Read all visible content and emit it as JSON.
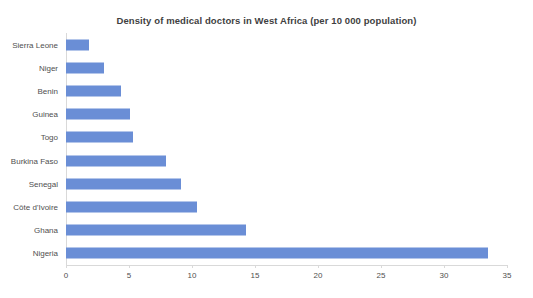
{
  "chart_data": {
    "type": "bar",
    "orientation": "horizontal",
    "title": "Density of medical doctors in West Africa  (per 10 000 population)",
    "xlabel": "",
    "ylabel": "",
    "categories": [
      "Sierra Leone",
      "Niger",
      "Benin",
      "Guinea",
      "Togo",
      "Burkina Faso",
      "Senegal",
      "Côte d'Ivoire",
      "Ghana",
      "Nigeria"
    ],
    "values": [
      1.8,
      3.0,
      4.4,
      5.1,
      5.3,
      7.9,
      9.1,
      10.4,
      14.3,
      33.5
    ],
    "xlim": [
      0,
      35
    ],
    "xticks": [
      0,
      5,
      10,
      15,
      20,
      25,
      30,
      35
    ],
    "xtick_labels": [
      "0",
      "5",
      "10",
      "15",
      "20",
      "25",
      "30",
      "35"
    ],
    "grid": false,
    "legend": false,
    "bar_color": "#6a8ed6",
    "axis_color": "#d9d9d9",
    "text_color": "#4f4f4f",
    "background": "#ffffff"
  }
}
